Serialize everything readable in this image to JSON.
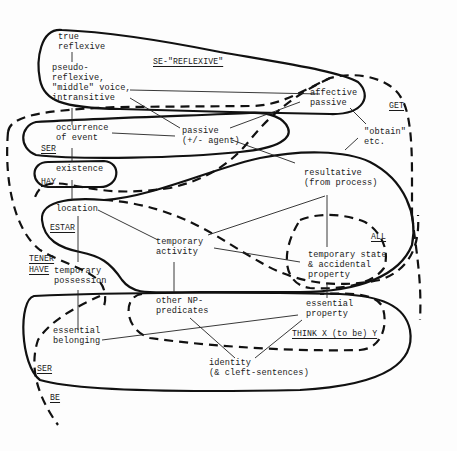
{
  "diagram": {
    "type": "semantic-map",
    "nodes": {
      "true_reflexive": "true\nreflexive",
      "pseudo_reflexive": "pseudo-\nreflexive,\n\"middle\" voice,\nintransitive",
      "affective_passive": "affective\npassive",
      "obtain": "\"obtain\"\netc.",
      "occurrence": "occurrence\nof event",
      "passive": "passive\n(+/- agent)",
      "existence": "existence",
      "resultative": "resultative\n(from process)",
      "location": "location",
      "temporary_activity": "temporary\nactivity",
      "temporary_state": "temporary state\n& accidental\nproperty",
      "temporary_possession": "temporary\npossession",
      "other_np": "other NP-\npredicates",
      "essential_property": "essential\nproperty",
      "essential_belonging": "essential\nbelonging",
      "identity": "identity\n(& cleft-sentences)"
    },
    "region_labels": {
      "se_reflexive": "SE-\"REFLEXIVE\"",
      "get": "GET",
      "ser_top": "SER",
      "hay": "HAY",
      "estar": "ESTAR",
      "all": "ALL",
      "tener": "TENER",
      "have": "HAVE",
      "think": "THINK X (to be) Y",
      "ser_bottom": "SER",
      "be": "BE"
    },
    "region_styles": {
      "solid": [
        "SE-\"REFLEXIVE\"",
        "SER",
        "HAY",
        "ESTAR",
        "SER"
      ],
      "dashed": [
        "GET",
        "ALL",
        "TENER/HAVE",
        "THINK X (to be) Y",
        "BE"
      ]
    },
    "links": [
      [
        "true reflexive",
        "pseudo-reflexive"
      ],
      [
        "pseudo-reflexive",
        "affective passive"
      ],
      [
        "pseudo-reflexive",
        "passive"
      ],
      [
        "pseudo-reflexive",
        "occurrence of event"
      ],
      [
        "occurrence of event",
        "passive"
      ],
      [
        "occurrence of event",
        "existence"
      ],
      [
        "existence",
        "location"
      ],
      [
        "passive",
        "affective passive"
      ],
      [
        "passive",
        "resultative"
      ],
      [
        "affective passive",
        "obtain"
      ],
      [
        "obtain",
        "resultative"
      ],
      [
        "resultative",
        "temporary activity"
      ],
      [
        "resultative",
        "temporary state"
      ],
      [
        "location",
        "temporary activity"
      ],
      [
        "location",
        "temporary possession"
      ],
      [
        "temporary activity",
        "temporary state"
      ],
      [
        "temporary activity",
        "other NP-predicates"
      ],
      [
        "temporary state",
        "essential property"
      ],
      [
        "temporary possession",
        "essential belonging"
      ],
      [
        "essential belonging",
        "essential property"
      ],
      [
        "other NP-predicates",
        "identity"
      ],
      [
        "essential property",
        "identity"
      ]
    ]
  }
}
